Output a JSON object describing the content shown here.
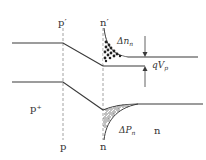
{
  "diagram": {
    "labels": {
      "p_prime_top": "p′",
      "n_prime_top": "n′",
      "p_bottom": "p",
      "n_bottom": "n",
      "p_region": "p⁺",
      "n_region": "n",
      "delta_n": "Δn",
      "delta_n_sub": "n",
      "delta_p": "ΔP",
      "delta_p_sub": "n",
      "qv": "qV",
      "qv_sub": "p"
    },
    "colors": {
      "line": "#3a3a3a",
      "dashed": "#8a8a8a",
      "electrons": "#222222",
      "holes": "#555555"
    }
  }
}
